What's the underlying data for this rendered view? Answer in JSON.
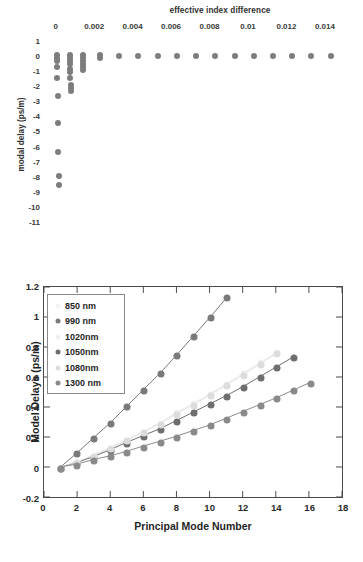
{
  "chart_data": [
    {
      "id": "top",
      "type": "scatter",
      "title": "effective index difference",
      "xlabel": "effective index difference",
      "ylabel": "modal delay (ps/m)",
      "xlim": [
        -0.0004,
        0.0152
      ],
      "ylim": [
        -11.6,
        1.4
      ],
      "xticks": [
        "0",
        "0.002",
        "0.004",
        "0.006",
        "0.008",
        "0.01",
        "0.012",
        "0.014"
      ],
      "xtick_values": [
        0,
        0.002,
        0.004,
        0.006,
        0.008,
        0.01,
        0.012,
        0.014
      ],
      "yticks": [
        "1",
        "0",
        "-1",
        "-2",
        "-3",
        "-4",
        "-5",
        "-6",
        "-7",
        "-8",
        "-9",
        "-10",
        "-11"
      ],
      "ytick_values": [
        1,
        0,
        -1,
        -2,
        -3,
        -4,
        -5,
        -6,
        -7,
        -8,
        -9,
        -10,
        -11
      ],
      "grid": false,
      "legend": "none",
      "marker_color": "#7d7d7d",
      "points": [
        [
          5e-05,
          0.05
        ],
        [
          5e-05,
          -0.12
        ],
        [
          5e-05,
          -0.3
        ],
        [
          8e-05,
          -0.75
        ],
        [
          8e-05,
          -1.45
        ],
        [
          0.0001,
          -2.65
        ],
        [
          0.00012,
          -4.45
        ],
        [
          0.00014,
          -6.35
        ],
        [
          0.00016,
          -7.95
        ],
        [
          0.00016,
          -8.55
        ],
        [
          0.00072,
          0.05
        ],
        [
          0.00072,
          -0.12
        ],
        [
          0.00072,
          -0.32
        ],
        [
          0.00072,
          -0.55
        ],
        [
          0.00074,
          -0.85
        ],
        [
          0.00074,
          -1.05
        ],
        [
          0.00076,
          -1.45
        ],
        [
          0.00078,
          -1.9
        ],
        [
          0.00078,
          -2.1
        ],
        [
          0.00078,
          -2.3
        ],
        [
          0.0014,
          0.05
        ],
        [
          0.0014,
          -0.1
        ],
        [
          0.0014,
          -0.3
        ],
        [
          0.0014,
          -0.5
        ],
        [
          0.0014,
          -0.7
        ],
        [
          0.00142,
          -0.9
        ],
        [
          0.0023,
          0.05
        ],
        [
          0.0023,
          -0.1
        ],
        [
          0.0033,
          0.0
        ],
        [
          0.0043,
          0.0
        ],
        [
          0.0053,
          0.0
        ],
        [
          0.0063,
          0.0
        ],
        [
          0.0073,
          0.0
        ],
        [
          0.0083,
          0.0
        ],
        [
          0.0093,
          0.0
        ],
        [
          0.0103,
          0.0
        ],
        [
          0.0113,
          0.0
        ],
        [
          0.0123,
          0.0
        ],
        [
          0.0133,
          0.0
        ],
        [
          0.0143,
          0.0
        ]
      ]
    },
    {
      "id": "bottom",
      "type": "line",
      "title": "",
      "xlabel": "Principal Mode Number",
      "ylabel": "Model Delays (ps/m)",
      "xlim": [
        0,
        18
      ],
      "ylim": [
        -0.2,
        1.2
      ],
      "xticks": [
        "0",
        "2",
        "4",
        "6",
        "8",
        "10",
        "12",
        "14",
        "16",
        "18"
      ],
      "xtick_values": [
        0,
        2,
        4,
        6,
        8,
        10,
        12,
        14,
        16,
        18
      ],
      "yticks": [
        "-0.2",
        "0",
        "0.2",
        "0.4",
        "0.6",
        "0.8",
        "1",
        "1.2"
      ],
      "ytick_values": [
        -0.2,
        0,
        0.2,
        0.4,
        0.6,
        0.8,
        1,
        1.2
      ],
      "grid": false,
      "legend_position": "upper-left",
      "series": [
        {
          "name": "850 nm",
          "color": "#f4f4f4",
          "x": [
            1,
            2,
            3,
            4,
            5,
            6,
            7,
            8,
            9,
            10,
            11
          ],
          "values": [
            0.0,
            0.095,
            0.195,
            0.295,
            0.405,
            0.515,
            0.625,
            0.745,
            0.87,
            0.995,
            1.125
          ]
        },
        {
          "name": "990 nm",
          "color": "#7a7a7a",
          "x": [
            1,
            2,
            3,
            4,
            5,
            6,
            7,
            8,
            9,
            10,
            11
          ],
          "values": [
            0.0,
            0.095,
            0.195,
            0.295,
            0.405,
            0.515,
            0.625,
            0.745,
            0.87,
            0.995,
            1.125
          ]
        },
        {
          "name": "1020nm",
          "color": "#f0f0f0",
          "x": [
            1,
            2,
            3,
            4,
            5,
            6,
            7,
            8,
            9,
            10,
            11,
            12,
            13,
            14
          ],
          "values": [
            0.0,
            0.035,
            0.075,
            0.125,
            0.175,
            0.235,
            0.295,
            0.365,
            0.425,
            0.49,
            0.555,
            0.625,
            0.695,
            0.765
          ]
        },
        {
          "name": "1050nm",
          "color": "#6e6e6e",
          "x": [
            1,
            2,
            3,
            4,
            5,
            6,
            7,
            8,
            9,
            10,
            11,
            12,
            13,
            14,
            15
          ],
          "values": [
            0.0,
            0.03,
            0.07,
            0.115,
            0.165,
            0.21,
            0.255,
            0.31,
            0.365,
            0.42,
            0.475,
            0.535,
            0.6,
            0.665,
            0.73
          ]
        },
        {
          "name": "1080nm",
          "color": "#dcdcdc",
          "x": [
            1,
            2,
            3,
            4,
            5,
            6,
            7,
            8,
            9,
            10,
            11,
            12,
            13,
            14
          ],
          "values": [
            0.0,
            0.035,
            0.08,
            0.13,
            0.18,
            0.235,
            0.29,
            0.355,
            0.415,
            0.48,
            0.545,
            0.615,
            0.685,
            0.755
          ]
        },
        {
          "name": "1300 nm",
          "color": "#8a8a8a",
          "x": [
            1,
            2,
            3,
            4,
            5,
            6,
            7,
            8,
            9,
            10,
            11,
            12,
            13,
            14,
            15,
            16
          ],
          "values": [
            0.0,
            0.02,
            0.05,
            0.075,
            0.105,
            0.14,
            0.172,
            0.205,
            0.243,
            0.28,
            0.325,
            0.37,
            0.415,
            0.46,
            0.51,
            0.56
          ]
        }
      ]
    }
  ]
}
